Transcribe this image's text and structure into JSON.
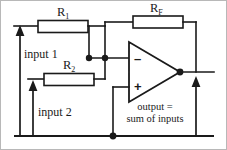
{
  "diagram": {
    "type": "circuit-schematic",
    "stroke_color": "#1a1a1a",
    "background_color": "#ffffff",
    "frame_color": "#b8b8b8"
  },
  "components": {
    "resistor_r1": {
      "label_main": "R",
      "label_sub": "1",
      "full_label": "R1"
    },
    "resistor_r2": {
      "label_main": "R",
      "label_sub": "2",
      "full_label": "R2"
    },
    "resistor_rf": {
      "label_main": "R",
      "label_sub": "F",
      "full_label": "RF"
    },
    "opamp": {
      "inverting_sign": "–",
      "noninverting_sign": "+"
    }
  },
  "labels": {
    "input_1": "input 1",
    "input_2": "input 2",
    "output_line_1": "output =",
    "output_line_2": "sum of inputs"
  }
}
